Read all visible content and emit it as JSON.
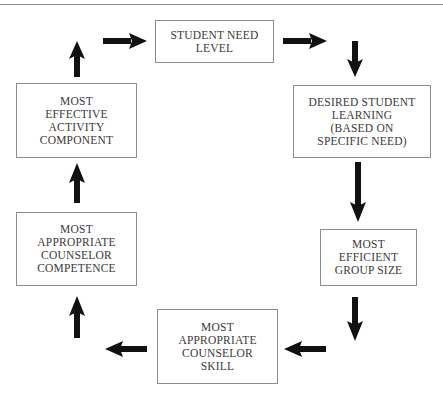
{
  "header": {
    "clipped_text": "...g g g ... y ... g ..."
  },
  "diagram": {
    "type": "cycle-flowchart",
    "nodes": [
      {
        "id": "student-need-level",
        "label": "STUDENT NEED\nLEVEL"
      },
      {
        "id": "desired-student-learning",
        "label": "DESIRED STUDENT\nLEARNING\n(BASED ON\nSPECIFIC NEED)"
      },
      {
        "id": "most-efficient-group-size",
        "label": "MOST\nEFFICIENT\nGROUP SIZE"
      },
      {
        "id": "most-appropriate-counselor-skill",
        "label": "MOST\nAPPROPRIATE\nCOUNSELOR\nSKILL"
      },
      {
        "id": "most-appropriate-counselor-competence",
        "label": "MOST\nAPPROPRIATE\nCOUNSELOR\nCOMPETENCE"
      },
      {
        "id": "most-effective-activity-component",
        "label": "MOST\nEFFECTIVE\nACTIVITY\nCOMPONENT"
      }
    ],
    "edges": [
      {
        "from": "student-need-level",
        "to": "desired-student-learning"
      },
      {
        "from": "desired-student-learning",
        "to": "most-efficient-group-size"
      },
      {
        "from": "most-efficient-group-size",
        "to": "most-appropriate-counselor-skill"
      },
      {
        "from": "most-appropriate-counselor-skill",
        "to": "most-appropriate-counselor-competence"
      },
      {
        "from": "most-appropriate-counselor-competence",
        "to": "most-effective-activity-component"
      },
      {
        "from": "most-effective-activity-component",
        "to": "student-need-level"
      }
    ],
    "colors": {
      "box_border": "#8c8c8c",
      "arrow": "#111111",
      "text": "#3a3a3a"
    }
  }
}
